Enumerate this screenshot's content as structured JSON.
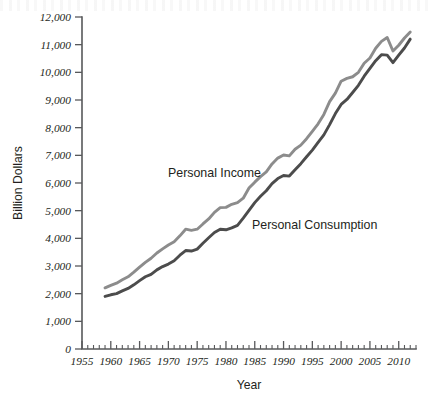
{
  "chart_data": {
    "type": "line",
    "title": "",
    "xlabel": "Year",
    "ylabel": "Billion Dollars",
    "xlim": [
      1955,
      2013
    ],
    "ylim": [
      0,
      12000
    ],
    "grid": false,
    "legend_position": "inline-annotation",
    "y_ticks": [
      0,
      1000,
      2000,
      3000,
      4000,
      5000,
      6000,
      7000,
      8000,
      9000,
      10000,
      11000,
      12000
    ],
    "y_tick_labels": [
      "0",
      "1,000",
      "2,000",
      "3,000",
      "4,000",
      "5,000",
      "6,000",
      "7,000",
      "8,000",
      "9,000",
      "10,000",
      "11,000",
      "12,000"
    ],
    "x_ticks": [
      1955,
      1960,
      1965,
      1970,
      1975,
      1980,
      1985,
      1990,
      1995,
      2000,
      2005,
      2010
    ],
    "x_tick_labels": [
      "1955",
      "1960",
      "1965",
      "1970",
      "1975",
      "1980",
      "1985",
      "1990",
      "1995",
      "2000",
      "2005",
      "2010"
    ],
    "x_minor_tick_step": 1,
    "x": [
      1959,
      1960,
      1961,
      1962,
      1963,
      1964,
      1965,
      1966,
      1967,
      1968,
      1969,
      1970,
      1971,
      1972,
      1973,
      1974,
      1975,
      1976,
      1977,
      1978,
      1979,
      1980,
      1981,
      1982,
      1983,
      1984,
      1985,
      1986,
      1987,
      1988,
      1989,
      1990,
      1991,
      1992,
      1993,
      1994,
      1995,
      1996,
      1997,
      1998,
      1999,
      2000,
      2001,
      2002,
      2003,
      2004,
      2005,
      2006,
      2007,
      2008,
      2009,
      2010,
      2011,
      2012
    ],
    "series": [
      {
        "name": "Personal Income",
        "color": "#8c8c8c",
        "values": [
          2210,
          2300,
          2380,
          2500,
          2610,
          2780,
          2960,
          3130,
          3280,
          3470,
          3620,
          3760,
          3880,
          4090,
          4330,
          4290,
          4330,
          4520,
          4700,
          4940,
          5110,
          5120,
          5230,
          5290,
          5450,
          5820,
          6030,
          6230,
          6400,
          6690,
          6900,
          7010,
          6980,
          7220,
          7370,
          7600,
          7870,
          8140,
          8480,
          8940,
          9250,
          9680,
          9780,
          9840,
          10000,
          10330,
          10520,
          10870,
          11120,
          11260,
          10770,
          10980,
          11240,
          11460
        ],
        "units": "Billion Dollars"
      },
      {
        "name": "Personal Consumption",
        "color": "#4c4c4c",
        "values": [
          1900,
          1960,
          2000,
          2100,
          2190,
          2320,
          2470,
          2610,
          2700,
          2860,
          2980,
          3070,
          3190,
          3390,
          3560,
          3540,
          3610,
          3820,
          4020,
          4210,
          4330,
          4310,
          4380,
          4470,
          4730,
          5010,
          5290,
          5520,
          5720,
          5980,
          6160,
          6270,
          6250,
          6480,
          6700,
          6950,
          7190,
          7470,
          7740,
          8110,
          8510,
          8840,
          9020,
          9270,
          9530,
          9860,
          10140,
          10420,
          10640,
          10620,
          10350,
          10620,
          10880,
          11200
        ],
        "units": "Billion Dollars"
      }
    ],
    "annotations": [
      {
        "text": "Personal Income",
        "x_px": 168,
        "y_px": 177,
        "series": "Personal Income"
      },
      {
        "text": "Personal Consumption",
        "x_px": 252,
        "y_px": 229,
        "series": "Personal Consumption"
      }
    ]
  }
}
